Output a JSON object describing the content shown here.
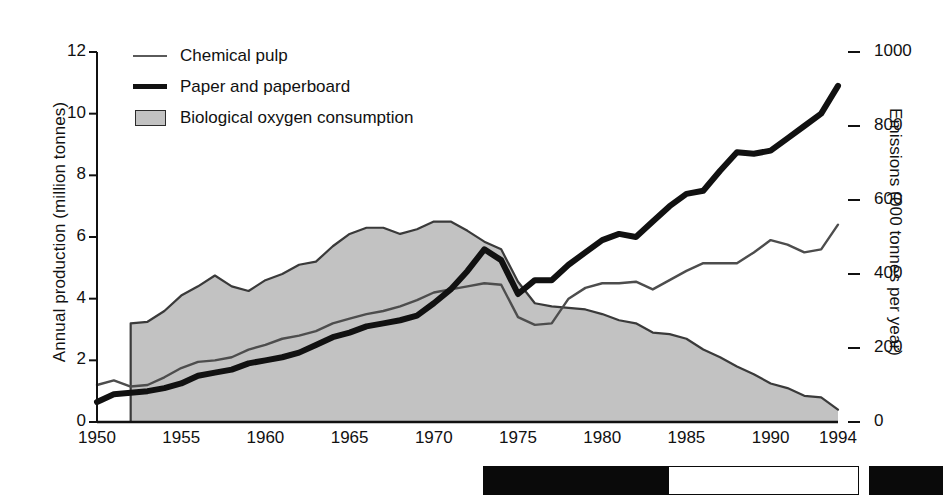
{
  "chart_data": {
    "type": "area",
    "title": "",
    "xlabel": "",
    "ylabel": "Annual production (million tonnes)",
    "ylabel_right": "Emissions (000 tonnes per year)",
    "xlim": [
      1950,
      1994
    ],
    "ylim": [
      0,
      12
    ],
    "ylim_right": [
      0,
      1000
    ],
    "yticks": [
      0,
      2,
      4,
      6,
      8,
      10,
      12
    ],
    "yticks_right": [
      0,
      200,
      400,
      600,
      800,
      1000
    ],
    "ytick_labels_right": [
      "0",
      "200",
      "400",
      "600",
      "800",
      "1000"
    ],
    "xticks": [
      1950,
      1955,
      1960,
      1965,
      1970,
      1975,
      1980,
      1985,
      1990,
      1994
    ],
    "grid": false,
    "legend_position": "top-left",
    "x": [
      1950,
      1951,
      1952,
      1953,
      1954,
      1955,
      1956,
      1957,
      1958,
      1959,
      1960,
      1961,
      1962,
      1963,
      1964,
      1965,
      1966,
      1967,
      1968,
      1969,
      1970,
      1971,
      1972,
      1973,
      1974,
      1975,
      1976,
      1977,
      1978,
      1979,
      1980,
      1981,
      1982,
      1983,
      1984,
      1985,
      1986,
      1987,
      1988,
      1989,
      1990,
      1991,
      1992,
      1993,
      1994
    ],
    "series": [
      {
        "name": "Chemical pulp",
        "axis": "left",
        "style": "thin-line",
        "color": "#4d4d4d",
        "values": [
          1.2,
          1.35,
          1.15,
          1.2,
          1.45,
          1.75,
          1.95,
          2.0,
          2.1,
          2.35,
          2.5,
          2.7,
          2.8,
          2.95,
          3.2,
          3.35,
          3.5,
          3.6,
          3.75,
          3.95,
          4.2,
          4.3,
          4.4,
          4.5,
          4.45,
          3.4,
          3.15,
          3.2,
          4.0,
          4.35,
          4.5,
          4.5,
          4.55,
          4.3,
          4.6,
          4.9,
          5.15,
          5.15,
          5.15,
          5.5,
          5.9,
          5.75,
          5.5,
          5.6,
          6.4
        ]
      },
      {
        "name": "Paper and paperboard",
        "axis": "left",
        "style": "thick-line",
        "color": "#111111",
        "values": [
          0.65,
          0.9,
          0.95,
          1.0,
          1.1,
          1.25,
          1.5,
          1.6,
          1.7,
          1.9,
          2.0,
          2.1,
          2.25,
          2.5,
          2.75,
          2.9,
          3.1,
          3.2,
          3.3,
          3.45,
          3.85,
          4.3,
          4.9,
          5.6,
          5.25,
          4.15,
          4.6,
          4.6,
          5.1,
          5.5,
          5.9,
          6.1,
          6.0,
          6.5,
          7.0,
          7.4,
          7.5,
          8.15,
          8.75,
          8.7,
          8.8,
          9.2,
          9.6,
          10.0,
          10.9
        ]
      },
      {
        "name": "Biological oxygen consumption",
        "axis": "right",
        "style": "filled-area",
        "fill": "#c2c2c2",
        "edge": "#3a3a3a",
        "values_left_units": [
          null,
          null,
          3.2,
          3.25,
          3.6,
          4.1,
          4.4,
          4.75,
          4.4,
          4.25,
          4.6,
          4.8,
          5.1,
          5.2,
          5.7,
          6.1,
          6.3,
          6.3,
          6.1,
          6.25,
          6.5,
          6.5,
          6.2,
          5.85,
          5.6,
          4.55,
          3.85,
          3.75,
          3.7,
          3.65,
          3.5,
          3.3,
          3.2,
          2.9,
          2.85,
          2.7,
          2.35,
          2.1,
          1.8,
          1.55,
          1.25,
          1.1,
          0.85,
          0.8,
          0.4
        ],
        "values": [
          null,
          null,
          267,
          271,
          300,
          342,
          367,
          396,
          367,
          354,
          383,
          400,
          425,
          433,
          475,
          508,
          525,
          525,
          508,
          521,
          542,
          542,
          517,
          488,
          467,
          379,
          321,
          313,
          308,
          304,
          292,
          275,
          267,
          242,
          238,
          225,
          196,
          175,
          150,
          129,
          104,
          92,
          71,
          67,
          33
        ]
      }
    ]
  },
  "legend": {
    "items": [
      {
        "label": "Chemical pulp",
        "swatch": "thin-line-swatch"
      },
      {
        "label": "Paper and paperboard",
        "swatch": "thick-line-swatch"
      },
      {
        "label": "Biological oxygen consumption",
        "swatch": "area-swatch"
      }
    ]
  },
  "colors": {
    "area_fill": "#c2c2c2",
    "area_edge": "#3a3a3a",
    "thick_line": "#111111",
    "thin_line": "#4d4d4d",
    "axis": "#111111",
    "background": "#ffffff"
  }
}
